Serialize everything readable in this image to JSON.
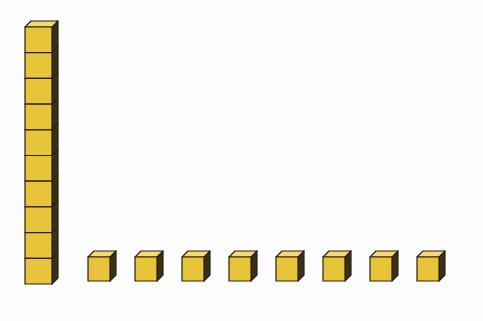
{
  "diagram": {
    "ten_rod": {
      "units": 10,
      "x": 25,
      "y": 27,
      "width": 27,
      "unit_height": 25.7,
      "depth": 6
    },
    "unit_cubes": {
      "count": 8,
      "positions_x": [
        88,
        135,
        182,
        229,
        276,
        323,
        370,
        417
      ],
      "y": 257,
      "size": 22,
      "depth": 6
    },
    "colors": {
      "front": "#E8C43A",
      "top": "#F3DA72",
      "side": "#3B2F18",
      "outline": "#2A2210",
      "background": "#FDFDFD"
    }
  }
}
